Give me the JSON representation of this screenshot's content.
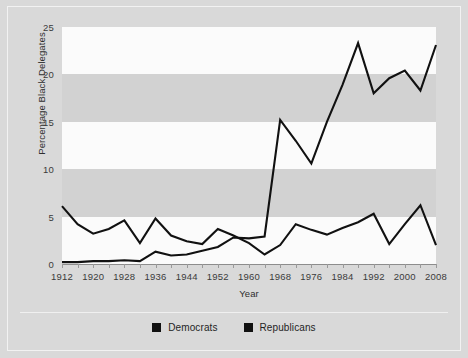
{
  "chart_data": {
    "type": "line",
    "title": "",
    "xlabel": "Year",
    "ylabel": "Percentage Black Delegates",
    "xlim": [
      1912,
      2008
    ],
    "ylim": [
      0,
      25
    ],
    "yticks": [
      0,
      5,
      10,
      15,
      20,
      25
    ],
    "xticks": [
      1912,
      1920,
      1928,
      1936,
      1944,
      1952,
      1960,
      1968,
      1976,
      1984,
      1992,
      2000,
      2008
    ],
    "xtick_step": 4,
    "grid": "alternating-horizontal-bands",
    "legend_position": "bottom-center",
    "x": [
      1912,
      1916,
      1920,
      1924,
      1928,
      1932,
      1936,
      1940,
      1944,
      1948,
      1952,
      1956,
      1960,
      1964,
      1968,
      1972,
      1976,
      1980,
      1984,
      1988,
      1992,
      1996,
      2000,
      2004,
      2008
    ],
    "series": [
      {
        "name": "Democrats",
        "color": "#111111",
        "values": [
          0.2,
          0.2,
          0.3,
          0.3,
          0.4,
          0.3,
          1.3,
          0.9,
          1.0,
          1.4,
          1.8,
          2.8,
          2.7,
          2.9,
          15.2,
          13.0,
          10.6,
          15.0,
          18.9,
          23.3,
          18.0,
          19.6,
          20.4,
          18.3,
          23.1
        ]
      },
      {
        "name": "Republicans",
        "color": "#111111",
        "values": [
          6.1,
          4.2,
          3.2,
          3.7,
          4.6,
          2.2,
          4.8,
          3.0,
          2.4,
          2.1,
          3.7,
          3.0,
          2.2,
          1.0,
          2.0,
          4.2,
          3.6,
          3.1,
          3.8,
          4.4,
          5.3,
          2.1,
          4.2,
          6.2,
          2.0
        ]
      }
    ]
  },
  "legend": {
    "items": [
      {
        "label": "Democrats"
      },
      {
        "label": "Republicans"
      }
    ]
  }
}
